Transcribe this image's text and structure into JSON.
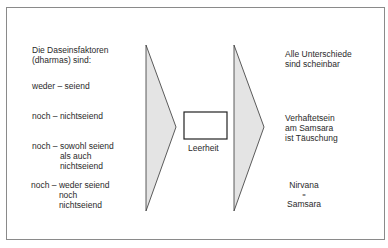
{
  "left_column": {
    "heading": "Die Daseinsfaktoren\n(dharmas) sind:",
    "items": [
      {
        "prefix": "weder – ",
        "text": "seiend"
      },
      {
        "prefix": "noch – ",
        "text": "nichtseiend"
      },
      {
        "prefix": "noch – ",
        "text": "sowohl seiend\nals auch\nnichtseiend"
      },
      {
        "prefix": "noch – ",
        "text": "weder seiend\nnoch\nnichtseiend"
      }
    ]
  },
  "center": {
    "box_label": "Leerheit"
  },
  "right_column": {
    "items": [
      "Alle Unterschiede\nsind scheinbar",
      "Verhaftetsein\nam Samsara\nist Täuschung"
    ],
    "equation": {
      "top": "Nirvana",
      "sign": "=",
      "bottom": "Samsara"
    }
  },
  "colors": {
    "triangle_fill": "#e4e4e4",
    "stroke": "#333333",
    "frame": "#8a8a8a"
  }
}
